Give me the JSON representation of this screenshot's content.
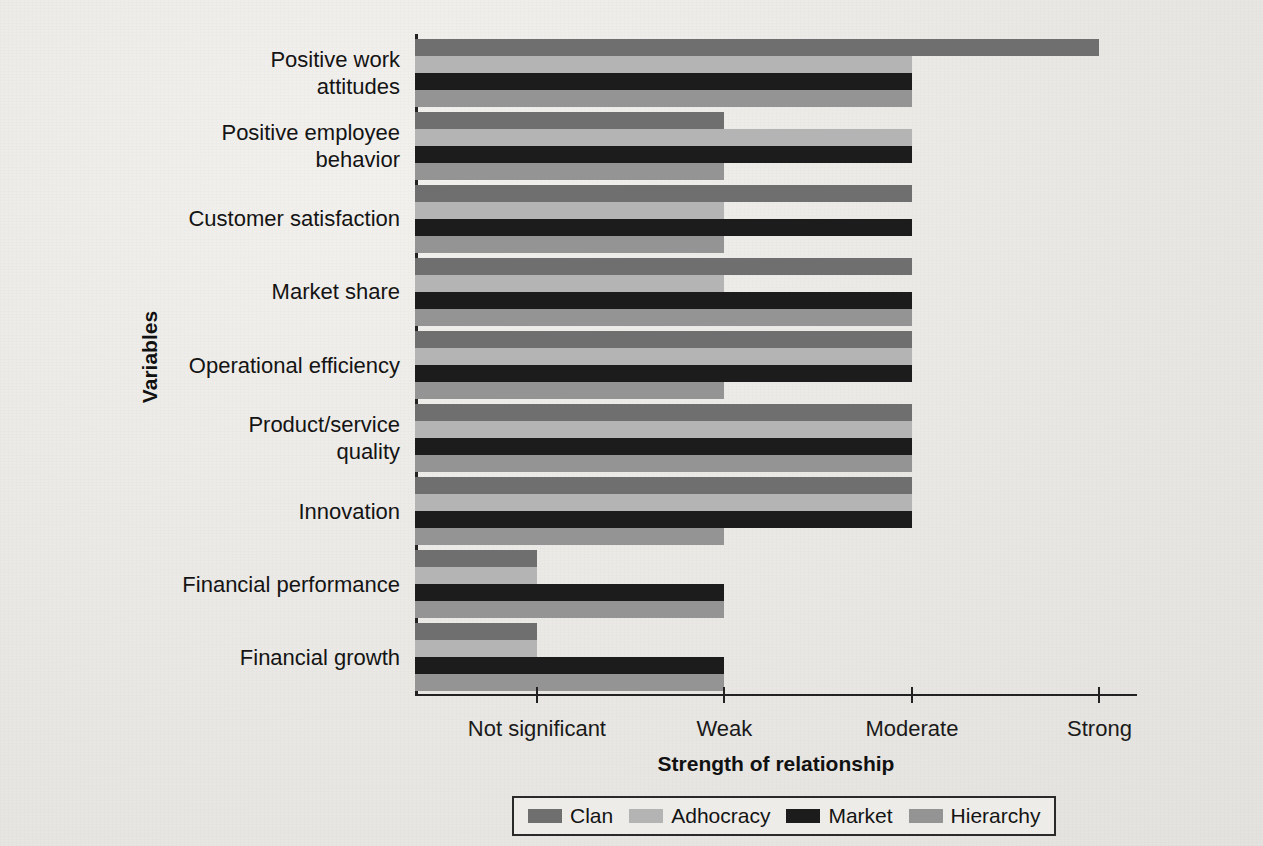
{
  "chart_data": {
    "type": "bar",
    "orientation": "horizontal",
    "title": "",
    "xlabel": "Strength of relationship",
    "ylabel": "Variables",
    "grid": false,
    "legend_position": "bottom",
    "xticklabels": [
      "Not significant",
      "Weak",
      "Moderate",
      "Strong"
    ],
    "xtickvalues": [
      1,
      2,
      3,
      4
    ],
    "xlim": [
      0.35,
      4.2
    ],
    "categories": [
      "Positive work attitudes",
      "Positive employee behavior",
      "Customer satisfaction",
      "Market share",
      "Operational efficiency",
      "Product/service quality",
      "Innovation",
      "Financial performance",
      "Financial growth"
    ],
    "category_lines": [
      [
        "Positive work",
        "attitudes"
      ],
      [
        "Positive employee",
        "behavior"
      ],
      [
        "Customer satisfaction"
      ],
      [
        "Market share"
      ],
      [
        "Operational efficiency"
      ],
      [
        "Product/service",
        "quality"
      ],
      [
        "Innovation"
      ],
      [
        "Financial performance"
      ],
      [
        "Financial growth"
      ]
    ],
    "series": [
      {
        "name": "Clan",
        "color": "#6f6f6f",
        "values": [
          4,
          2,
          3,
          3,
          3,
          3,
          3,
          1,
          1
        ]
      },
      {
        "name": "Adhocracy",
        "color": "#b4b4b4",
        "values": [
          3,
          3,
          2,
          2,
          3,
          3,
          3,
          1,
          1
        ]
      },
      {
        "name": "Market",
        "color": "#1c1c1c",
        "values": [
          3,
          3,
          3,
          3,
          3,
          3,
          3,
          2,
          2
        ]
      },
      {
        "name": "Hierarchy",
        "color": "#949494",
        "values": [
          3,
          2,
          2,
          3,
          2,
          3,
          2,
          2,
          2
        ]
      }
    ]
  },
  "legend": {
    "items": [
      {
        "label": "Clan",
        "color": "#6f6f6f"
      },
      {
        "label": "Adhocracy",
        "color": "#b4b4b4"
      },
      {
        "label": "Market",
        "color": "#1c1c1c"
      },
      {
        "label": "Hierarchy",
        "color": "#949494"
      }
    ]
  },
  "axes": {
    "x_title": "Strength of relationship",
    "y_title": "Variables"
  }
}
